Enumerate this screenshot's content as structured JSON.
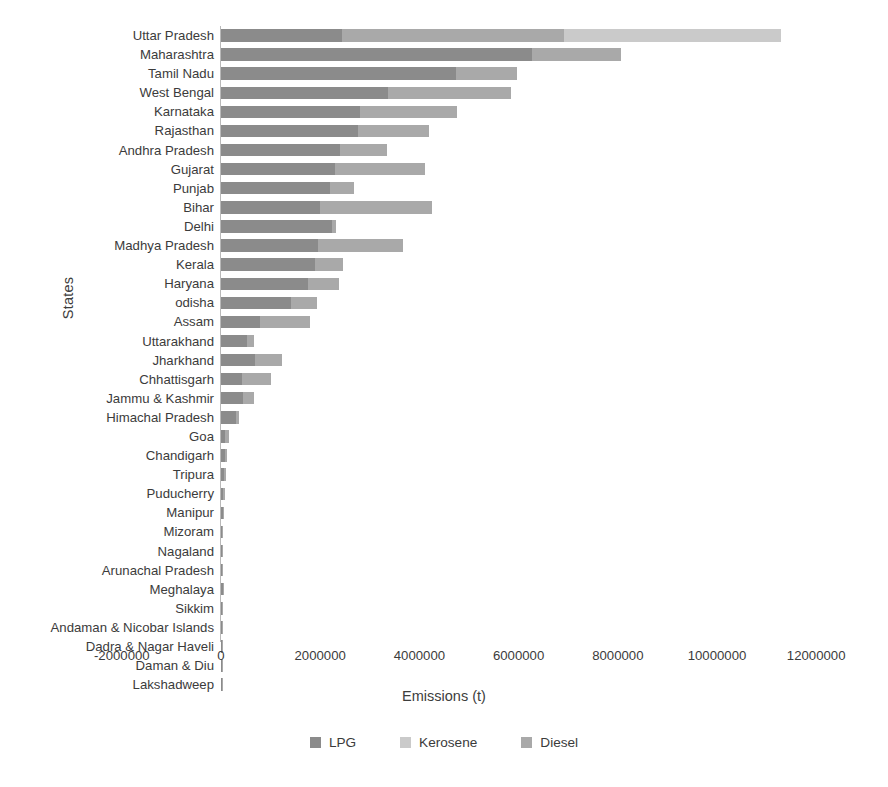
{
  "chart_data": {
    "type": "bar",
    "orientation": "horizontal",
    "stacked": true,
    "title": "",
    "xlabel": "Emissions (t)",
    "ylabel": "States",
    "xlim": [
      -2000000,
      12000000
    ],
    "xticks": [
      "-2000000",
      "0",
      "2000000",
      "4000000",
      "6000000",
      "8000000",
      "10000000",
      "12000000"
    ],
    "xtick_values": [
      -2000000,
      0,
      2000000,
      4000000,
      6000000,
      8000000,
      10000000,
      12000000
    ],
    "grid": false,
    "legend_position": "bottom",
    "series": [
      {
        "name": "LPG",
        "color": "#8b8b8b",
        "values": [
          2430000,
          6270000,
          4730000,
          3360000,
          2800000,
          2760000,
          2390000,
          2300000,
          2200000,
          2000000,
          2230000,
          1950000,
          1890000,
          1750000,
          1420000,
          780000,
          530000,
          680000,
          430000,
          440000,
          300000,
          90000,
          85000,
          60000,
          50000,
          45000,
          30000,
          25000,
          25000,
          40000,
          12000,
          10000,
          7000,
          6000,
          4000
        ]
      },
      {
        "name": "Diesel",
        "color": "#a9a9a9",
        "values": [
          4480000,
          1800000,
          1230000,
          2490000,
          1950000,
          1430000,
          960000,
          1820000,
          490000,
          2260000,
          90000,
          1710000,
          570000,
          620000,
          510000,
          1010000,
          140000,
          560000,
          570000,
          230000,
          70000,
          70000,
          30000,
          50000,
          30000,
          25000,
          20000,
          15000,
          20000,
          20000,
          6000,
          5000,
          4000,
          4000,
          3000
        ]
      },
      {
        "name": "Kerosene",
        "color": "#cacaca",
        "values": [
          4390000,
          0,
          0,
          0,
          0,
          0,
          0,
          0,
          0,
          0,
          0,
          0,
          0,
          0,
          0,
          0,
          0,
          0,
          0,
          0,
          0,
          0,
          0,
          0,
          0,
          0,
          0,
          0,
          0,
          0,
          0,
          0,
          0,
          0,
          0
        ]
      }
    ],
    "categories": [
      "Uttar Pradesh",
      "Maharashtra",
      "Tamil Nadu",
      "West Bengal",
      "Karnataka",
      "Rajasthan",
      "Andhra Pradesh",
      "Gujarat",
      "Punjab",
      "Bihar",
      "Delhi",
      "Madhya Pradesh",
      "Kerala",
      "Haryana",
      "odisha",
      "Assam",
      "Uttarakhand",
      "Jharkhand",
      "Chhattisgarh",
      "Jammu & Kashmir",
      "Himachal Pradesh",
      "Goa",
      "Chandigarh",
      "Tripura",
      "Puducherry",
      "Manipur",
      "Mizoram",
      "Nagaland",
      "Arunachal Pradesh",
      "Meghalaya",
      "Sikkim",
      "Andaman & Nicobar Islands",
      "Dadra & Nagar Haveli",
      "Daman & Diu",
      "Lakshadweep"
    ],
    "bars": [
      {
        "label": "Uttar Pradesh",
        "lpg": 2430000,
        "diesel": 4480000,
        "kerosene": 4390000,
        "total": 11300000
      },
      {
        "label": "Maharashtra",
        "lpg": 6270000,
        "diesel": 1800000,
        "kerosene": 0,
        "total": 8070000
      },
      {
        "label": "Tamil Nadu",
        "lpg": 4730000,
        "diesel": 1230000,
        "kerosene": 0,
        "total": 5960000
      },
      {
        "label": "West Bengal",
        "lpg": 3360000,
        "diesel": 2490000,
        "kerosene": 0,
        "total": 5850000
      },
      {
        "label": "Karnataka",
        "lpg": 2800000,
        "diesel": 1950000,
        "kerosene": 0,
        "total": 4750000
      },
      {
        "label": "Rajasthan",
        "lpg": 2760000,
        "diesel": 1430000,
        "kerosene": 0,
        "total": 4190000
      },
      {
        "label": "Andhra Pradesh",
        "lpg": 2390000,
        "diesel": 960000,
        "kerosene": 0,
        "total": 3350000
      },
      {
        "label": "Gujarat",
        "lpg": 2300000,
        "diesel": 1820000,
        "kerosene": 0,
        "total": 4120000
      },
      {
        "label": "Punjab",
        "lpg": 2200000,
        "diesel": 490000,
        "kerosene": 0,
        "total": 2690000
      },
      {
        "label": "Bihar",
        "lpg": 2000000,
        "diesel": 2260000,
        "kerosene": 0,
        "total": 4260000
      },
      {
        "label": "Delhi",
        "lpg": 2230000,
        "diesel": 90000,
        "kerosene": 0,
        "total": 2320000
      },
      {
        "label": "Madhya Pradesh",
        "lpg": 1950000,
        "diesel": 1710000,
        "kerosene": 0,
        "total": 3660000
      },
      {
        "label": "Kerala",
        "lpg": 1890000,
        "diesel": 570000,
        "kerosene": 0,
        "total": 2460000
      },
      {
        "label": "Haryana",
        "lpg": 1750000,
        "diesel": 620000,
        "kerosene": 0,
        "total": 2370000
      },
      {
        "label": "odisha",
        "lpg": 1420000,
        "diesel": 510000,
        "kerosene": 0,
        "total": 1930000
      },
      {
        "label": "Assam",
        "lpg": 780000,
        "diesel": 1010000,
        "kerosene": 0,
        "total": 1790000
      },
      {
        "label": "Uttarakhand",
        "lpg": 530000,
        "diesel": 140000,
        "kerosene": 0,
        "total": 670000
      },
      {
        "label": "Jharkhand",
        "lpg": 680000,
        "diesel": 560000,
        "kerosene": 0,
        "total": 1240000
      },
      {
        "label": "Chhattisgarh",
        "lpg": 430000,
        "diesel": 570000,
        "kerosene": 0,
        "total": 1000000
      },
      {
        "label": "Jammu & Kashmir",
        "lpg": 440000,
        "diesel": 230000,
        "kerosene": 0,
        "total": 670000
      },
      {
        "label": "Himachal Pradesh",
        "lpg": 300000,
        "diesel": 70000,
        "kerosene": 0,
        "total": 370000
      },
      {
        "label": "Goa",
        "lpg": 90000,
        "diesel": 70000,
        "kerosene": 0,
        "total": 160000
      },
      {
        "label": "Chandigarh",
        "lpg": 85000,
        "diesel": 30000,
        "kerosene": 0,
        "total": 115000
      },
      {
        "label": "Tripura",
        "lpg": 60000,
        "diesel": 50000,
        "kerosene": 0,
        "total": 110000
      },
      {
        "label": "Puducherry",
        "lpg": 50000,
        "diesel": 30000,
        "kerosene": 0,
        "total": 80000
      },
      {
        "label": "Manipur",
        "lpg": 45000,
        "diesel": 25000,
        "kerosene": 0,
        "total": 70000
      },
      {
        "label": "Mizoram",
        "lpg": 30000,
        "diesel": 20000,
        "kerosene": 0,
        "total": 50000
      },
      {
        "label": "Nagaland",
        "lpg": 25000,
        "diesel": 15000,
        "kerosene": 0,
        "total": 40000
      },
      {
        "label": "Arunachal Pradesh",
        "lpg": 25000,
        "diesel": 20000,
        "kerosene": 0,
        "total": 45000
      },
      {
        "label": "Meghalaya",
        "lpg": 40000,
        "diesel": 20000,
        "kerosene": 0,
        "total": 60000
      },
      {
        "label": "Sikkim",
        "lpg": 12000,
        "diesel": 6000,
        "kerosene": 0,
        "total": 18000
      },
      {
        "label": "Andaman & Nicobar Islands",
        "lpg": 10000,
        "diesel": 5000,
        "kerosene": 0,
        "total": 15000
      },
      {
        "label": "Dadra & Nagar Haveli",
        "lpg": 7000,
        "diesel": 4000,
        "kerosene": 0,
        "total": 11000
      },
      {
        "label": "Daman & Diu",
        "lpg": 6000,
        "diesel": 4000,
        "kerosene": 0,
        "total": 10000
      },
      {
        "label": "Lakshadweep",
        "lpg": 4000,
        "diesel": 3000,
        "kerosene": 0,
        "total": 7000
      }
    ]
  },
  "legend": {
    "items": [
      {
        "label": "LPG",
        "color": "#8b8b8b",
        "swatch": "legend-swatch-lpg"
      },
      {
        "label": "Kerosene",
        "color": "#cacaca",
        "swatch": "legend-swatch-kerosene"
      },
      {
        "label": "Diesel",
        "color": "#a9a9a9",
        "swatch": "legend-swatch-diesel"
      }
    ]
  }
}
